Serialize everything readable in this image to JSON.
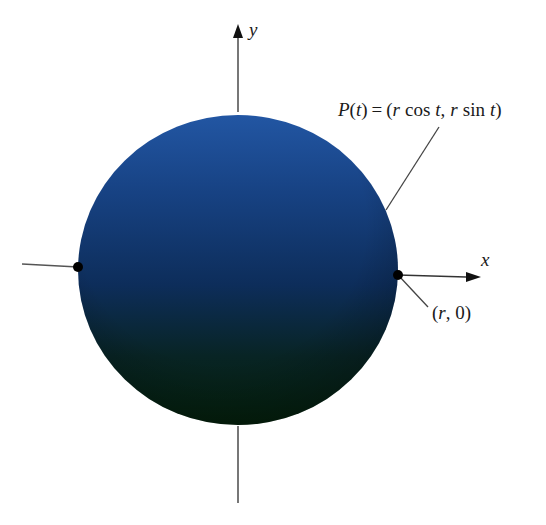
{
  "figure": {
    "axes": {
      "x_label": "x",
      "y_label": "y"
    },
    "labels": {
      "point_p": {
        "name": "P",
        "arg": "t",
        "equals": "=",
        "open": "(",
        "r1": "r",
        "cos": "cos",
        "t1": "t",
        "comma": ",",
        "r2": "r",
        "sin": "sin",
        "t2": "t",
        "close": ")"
      },
      "point_r0": "(r, 0)",
      "point_r0_parts": {
        "open": "(",
        "r": "r",
        "rest": ", 0)"
      }
    },
    "colors": {
      "sphere_top": "#1f4f97",
      "sphere_mid": "#0d2e5c",
      "sphere_bottom": "#06230f",
      "axis": "#555555",
      "dot": "#000000"
    }
  }
}
